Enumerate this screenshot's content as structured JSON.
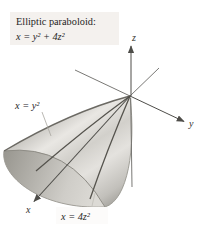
{
  "figure": {
    "title_box": {
      "title": "Elliptic paraboloid:",
      "equation": "x = y² + 4z²"
    },
    "surface_labels": {
      "xy_trace": "x = y²",
      "xz_trace": "x = 4z²"
    },
    "axis_labels": {
      "x": "x",
      "y": "y",
      "z": "z"
    },
    "colors": {
      "title_box_bg": "#f4f1ee",
      "surface_highlight": "#e9e7e3",
      "surface_shadow": "#97958f",
      "inside_shadow": "#98968f",
      "trace_line": "#56544e",
      "axis_line": "#4e4d49"
    }
  }
}
